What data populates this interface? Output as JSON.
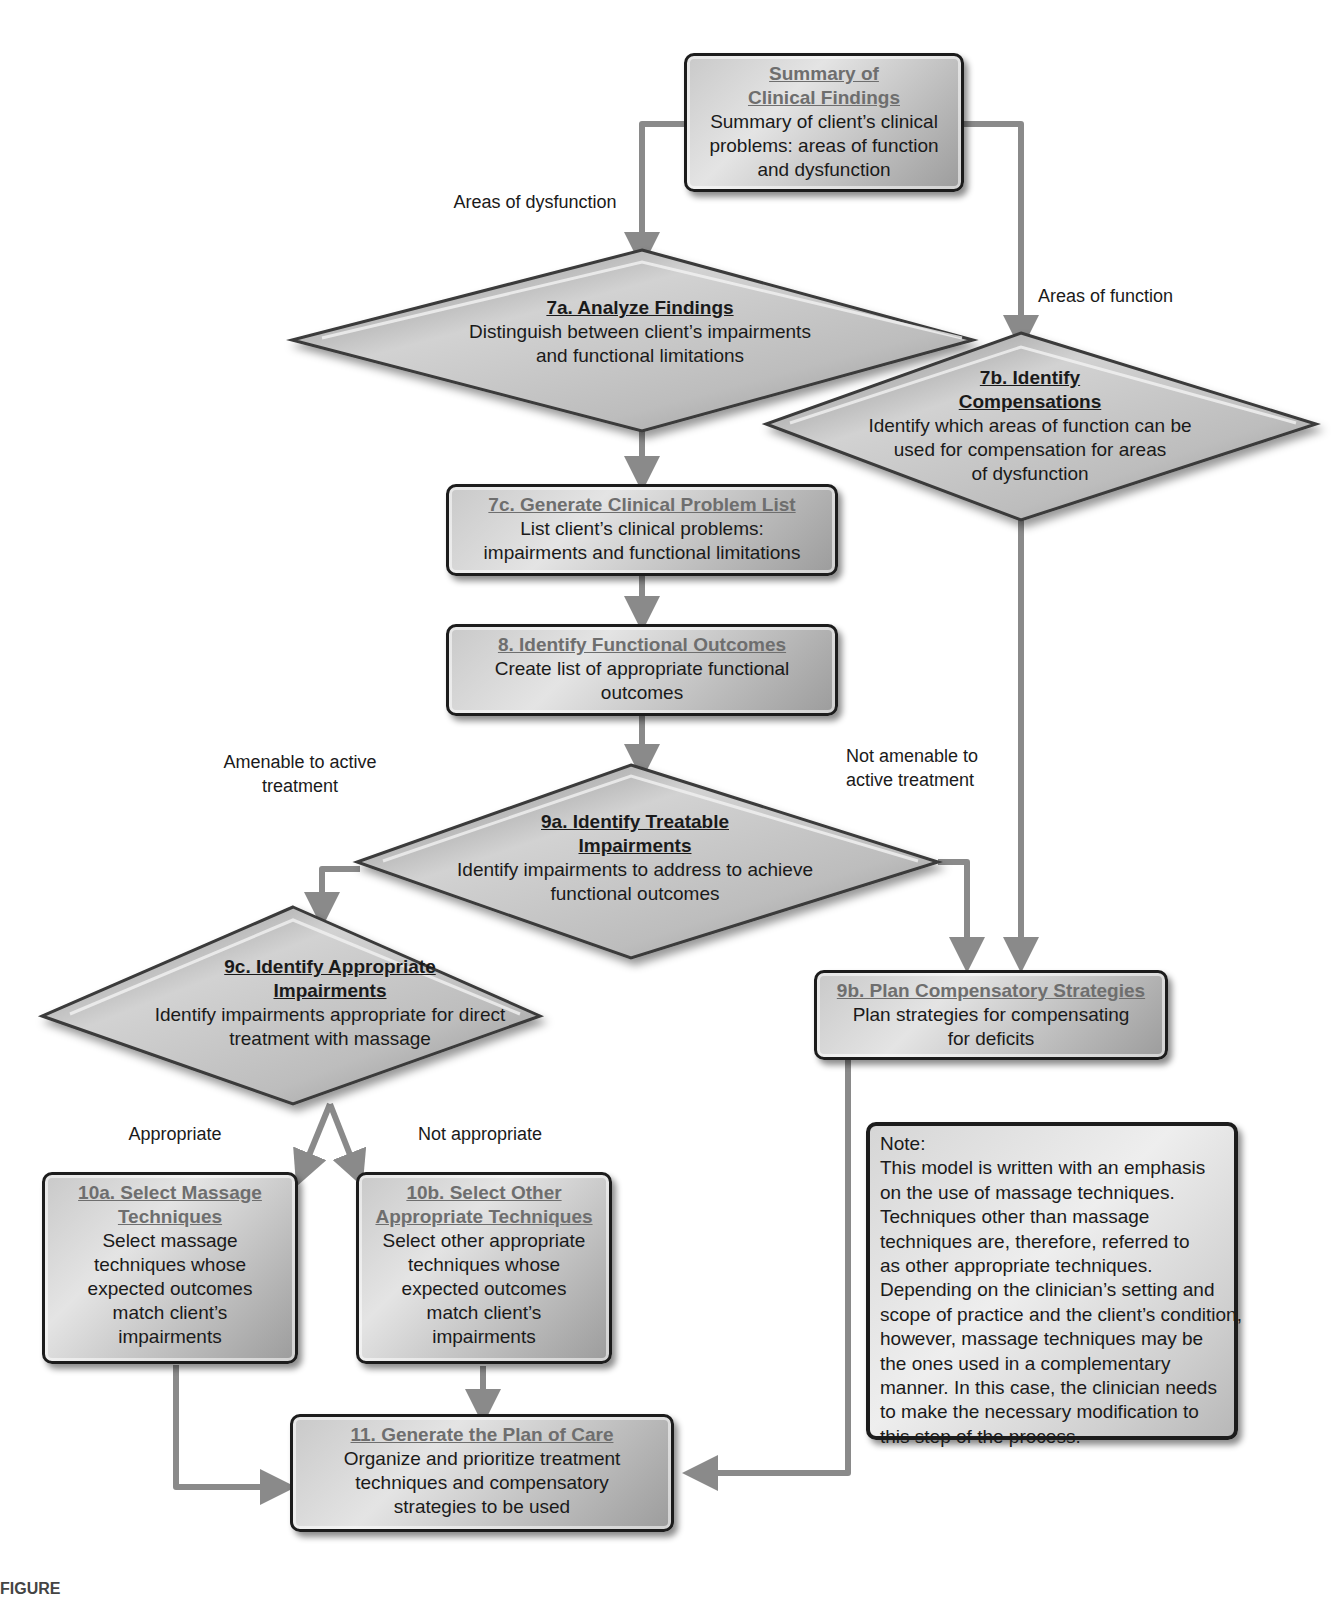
{
  "colors": {
    "box_border": "#1c1c1c",
    "box_fill_light": "#e4e4e4",
    "box_fill_dark": "#9c9c9c",
    "box_title_text": "#6e6e6e",
    "diamond_fill": "#b5b5b5",
    "connector": "#8a8a8a",
    "text": "#1a1a1a"
  },
  "nodes": {
    "summary": {
      "title": "Summary of Clinical Findings",
      "title_line1": "Summary of",
      "title_line2": "Clinical Findings",
      "desc_lines": [
        "Summary of client’s clinical",
        "problems: areas of function",
        "and dysfunction"
      ]
    },
    "n7a": {
      "title": "7a. Analyze Findings",
      "desc_lines": [
        "Distinguish between client’s impairments",
        "and functional limitations"
      ]
    },
    "n7b": {
      "title_line1": "7b. Identify",
      "title_line2": "Compensations",
      "desc_lines": [
        "Identify which areas of function can be",
        "used for compensation for areas",
        "of dysfunction"
      ]
    },
    "n7c": {
      "title": "7c. Generate Clinical Problem List",
      "desc_lines": [
        "List client’s clinical problems:",
        "impairments and functional limitations"
      ]
    },
    "n8": {
      "title": "8. Identify Functional Outcomes",
      "desc_lines": [
        "Create list of appropriate functional",
        "outcomes"
      ]
    },
    "n9a": {
      "title_line1": "9a. Identify Treatable",
      "title_line2": "Impairments",
      "desc_lines": [
        "Identify impairments to address to achieve",
        "functional outcomes"
      ]
    },
    "n9b": {
      "title": "9b. Plan Compensatory Strategies",
      "desc_lines": [
        "Plan strategies for compensating",
        "for deficits"
      ]
    },
    "n9c": {
      "title_line1": "9c. Identify Appropriate",
      "title_line2": "Impairments",
      "desc_lines": [
        "Identify impairments  appropriate for direct",
        "treatment with massage"
      ]
    },
    "n10a": {
      "title_line1": "10a. Select Massage",
      "title_line2": "Techniques",
      "desc_lines": [
        "Select massage",
        "techniques whose",
        "expected outcomes",
        "match client’s",
        "impairments"
      ]
    },
    "n10b": {
      "title_line1": "10b. Select Other",
      "title_line2": "Appropriate Techniques",
      "desc_lines": [
        "Select other appropriate",
        "techniques whose",
        "expected outcomes",
        "match client’s",
        "impairments"
      ]
    },
    "n11": {
      "title": "11. Generate the Plan of Care",
      "desc_lines": [
        "Organize and prioritize treatment",
        "techniques and compensatory",
        "strategies to be used"
      ]
    }
  },
  "edge_labels": {
    "areas_of_dysfunction": "Areas of dysfunction",
    "areas_of_function": "Areas of function",
    "amenable_line1": "Amenable to active",
    "amenable_line2": "treatment",
    "not_amenable_line1": "Not amenable to",
    "not_amenable_line2": "active treatment",
    "appropriate": "Appropriate",
    "not_appropriate": "Not appropriate"
  },
  "note": {
    "heading": "Note:",
    "lines": [
      "This model is written with an emphasis",
      "on the use of massage techniques.",
      "Techniques other than massage",
      "techniques are, therefore, referred to",
      "as other appropriate techniques.",
      "Depending on the clinician’s setting and",
      "scope of practice and the client’s condition,",
      "however, massage techniques may be",
      "the ones used in a complementary",
      "manner. In this case, the clinician needs",
      "to make the necessary modification to",
      "this step of the process."
    ]
  },
  "caption": {
    "text": "FIGURE"
  }
}
